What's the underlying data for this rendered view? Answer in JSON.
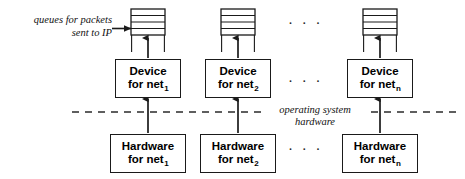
{
  "diagram": {
    "background": "#ffffff",
    "stroke_color": "#1a1a1a",
    "text_color": "#000000",
    "width": 465,
    "height": 179
  },
  "caption": {
    "queues_line1": "queues for packets",
    "queues_line2": "sent to IP"
  },
  "divider": {
    "label_line1": "operating system",
    "label_line2": "hardware",
    "style": "dashed",
    "x_start": 72,
    "x_end": 458,
    "y": 112
  },
  "columns": [
    {
      "index": 1,
      "center_x": 148,
      "queue": {
        "slots": 4,
        "name": "packet-queue"
      },
      "device": {
        "line1": "Device",
        "line2_prefix": "for net",
        "line2_sub": "1"
      },
      "hardware": {
        "line1": "Hardware",
        "line2_prefix": "for net",
        "line2_sub": "1"
      }
    },
    {
      "index": 2,
      "center_x": 238,
      "queue": {
        "slots": 4,
        "name": "packet-queue"
      },
      "device": {
        "line1": "Device",
        "line2_prefix": "for net",
        "line2_sub": "2"
      },
      "hardware": {
        "line1": "Hardware",
        "line2_prefix": "for net",
        "line2_sub": "2"
      }
    },
    {
      "index": 3,
      "center_x": 380,
      "queue": {
        "slots": 4,
        "name": "packet-queue"
      },
      "device": {
        "line1": "Device",
        "line2_prefix": "for net",
        "line2_sub": "n"
      },
      "hardware": {
        "line1": "Hardware",
        "line2_prefix": "for net",
        "line2_sub": "n"
      }
    }
  ],
  "ellipses": [
    {
      "name": "ellipsis-queue-row",
      "text": "· · ·",
      "x": 288,
      "y": 16
    },
    {
      "name": "ellipsis-device-row",
      "text": "· · ·",
      "x": 288,
      "y": 74
    },
    {
      "name": "ellipsis-hardware-row",
      "text": "· · ·",
      "x": 288,
      "y": 142
    }
  ]
}
